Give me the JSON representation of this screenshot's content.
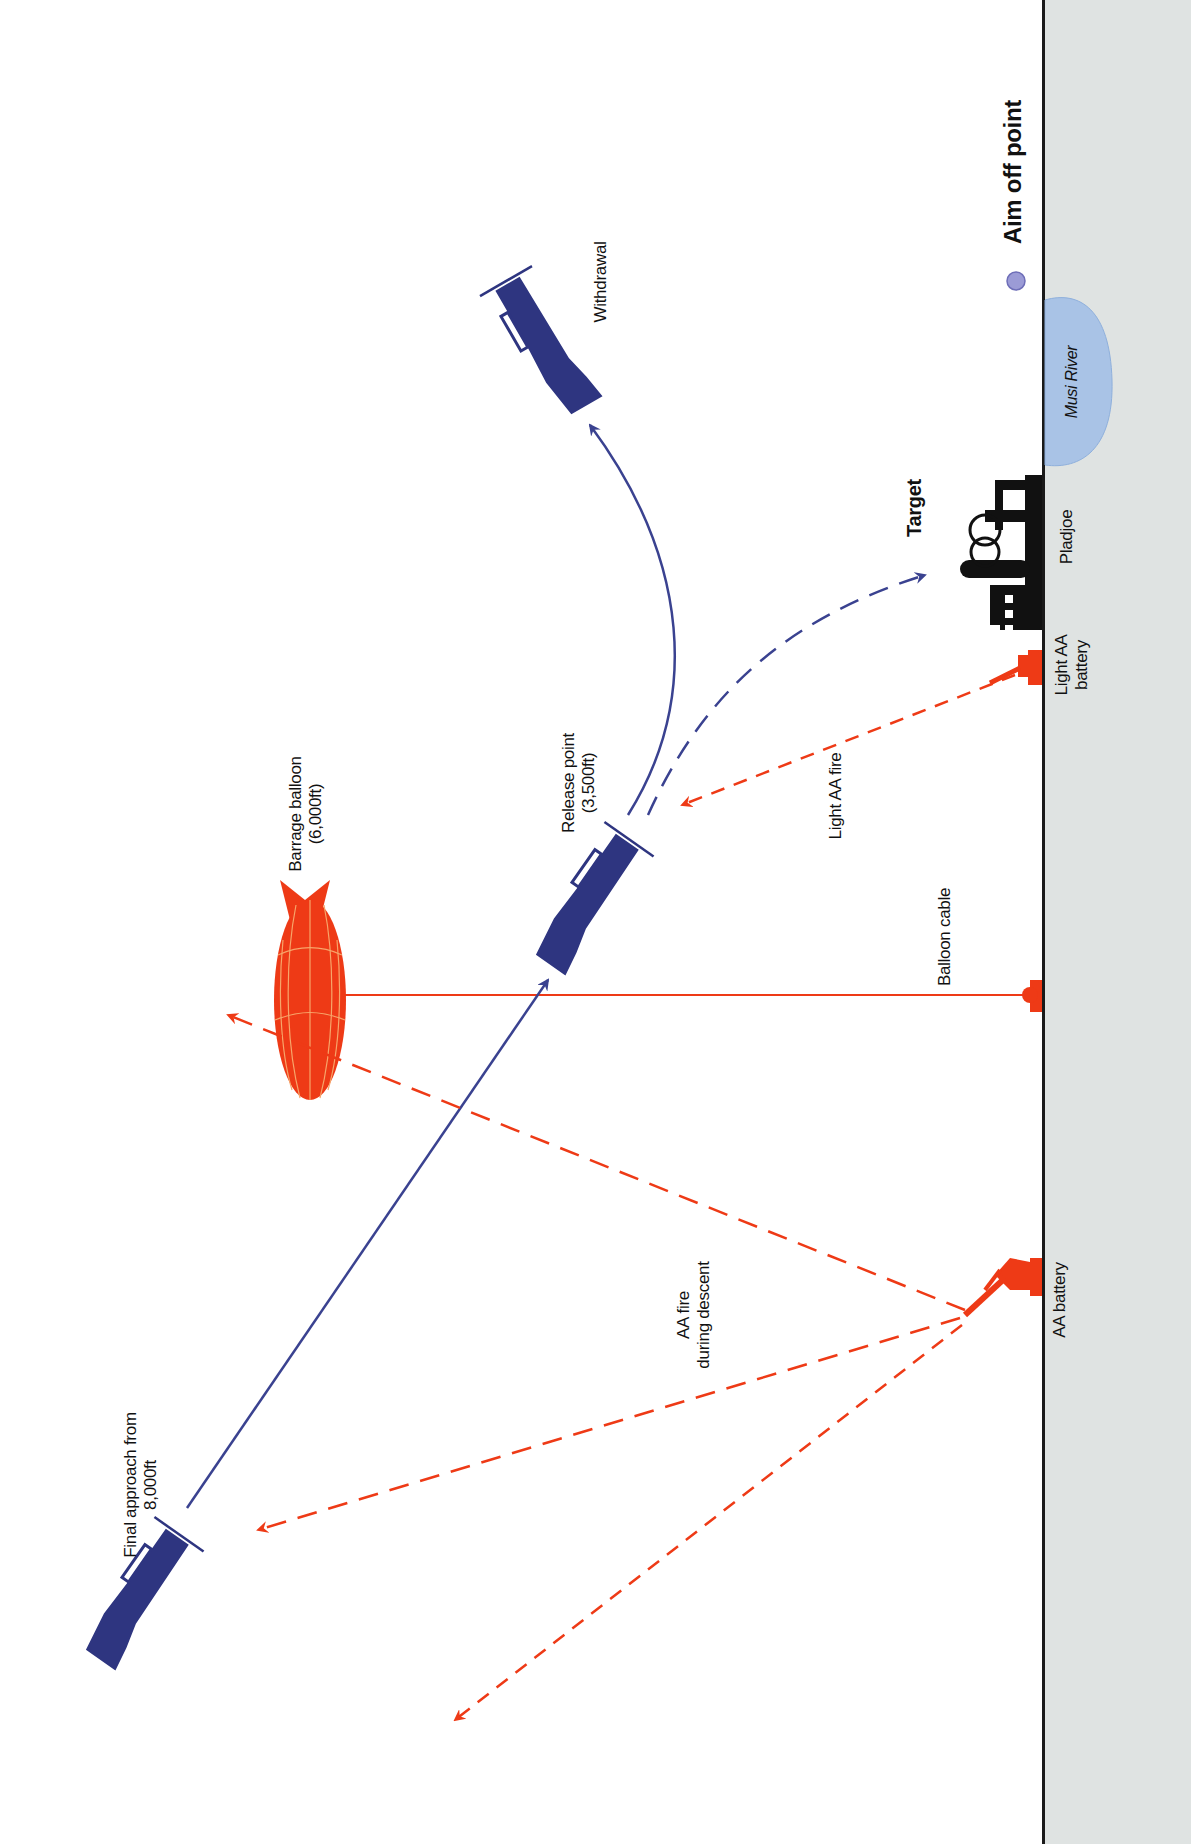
{
  "diagram": {
    "orientation": "rotated 90deg counter-clockwise (ground on right)",
    "colors": {
      "aircraft": "#2e3580",
      "flight_path": "#3a4290",
      "enemy": "#ee3a16",
      "ground": "#dfe3e2",
      "ground_line": "#1a1a1a",
      "river": "#a9c3e6",
      "aim_point": "#9b9bd6",
      "target": "#111111"
    },
    "labels": {
      "aim_off_point": "Aim off point",
      "musi_river": "Musi River",
      "target": "Target",
      "pladjoe": "Pladjoe",
      "light_aa_battery": "Light AA\nbattery",
      "withdrawal": "Withdrawal",
      "light_aa_fire": "Light AA fire",
      "release_point": "Release point\n(3,500ft)",
      "barrage_balloon": "Barrage balloon\n(6,000ft)",
      "balloon_cable": "Balloon cable",
      "aa_battery": "AA battery",
      "aa_fire_during_descent": "AA fire\nduring descent",
      "final_approach": "Final approach from\n8,000ft"
    },
    "nodes": [
      {
        "id": "final-approach-aircraft",
        "label": "Final approach from 8,000ft"
      },
      {
        "id": "release-point-aircraft",
        "label": "Release point (3,500ft)"
      },
      {
        "id": "withdrawal-aircraft",
        "label": "Withdrawal"
      },
      {
        "id": "barrage-balloon",
        "label": "Barrage balloon (6,000ft)"
      },
      {
        "id": "target-refinery",
        "label": "Target / Pladjoe"
      },
      {
        "id": "light-aa-battery",
        "label": "Light AA battery"
      },
      {
        "id": "aa-battery",
        "label": "AA battery"
      },
      {
        "id": "musi-river",
        "label": "Musi River"
      },
      {
        "id": "aim-off-point",
        "label": "Aim off point"
      }
    ],
    "edges": [
      {
        "from": "final-approach-aircraft",
        "to": "release-point-aircraft",
        "style": "solid",
        "label": "dive path"
      },
      {
        "from": "release-point-aircraft",
        "to": "withdrawal-aircraft",
        "style": "solid curve"
      },
      {
        "from": "release-point-aircraft",
        "to": "target-refinery",
        "style": "dashed",
        "label": "bomb trajectory"
      },
      {
        "from": "light-aa-battery",
        "to": "release-point-aircraft",
        "style": "dashed red",
        "label": "Light AA fire"
      },
      {
        "from": "aa-battery",
        "to": "final-approach-aircraft",
        "style": "dashed red",
        "label": "AA fire during descent"
      },
      {
        "from": "barrage-balloon",
        "to": "ground",
        "style": "solid red",
        "label": "Balloon cable"
      }
    ]
  }
}
